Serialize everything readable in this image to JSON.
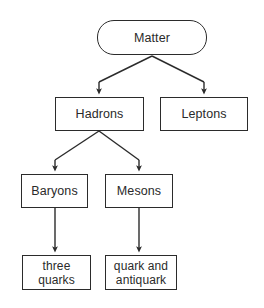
{
  "diagram": {
    "style": {
      "background": "#ffffff",
      "node_fill": "#ffffff",
      "node_stroke": "#2b2b2b",
      "text_color": "#2a2a2a",
      "edge_color": "#2b2b2b"
    },
    "nodes": [
      {
        "id": "matter",
        "label": "Matter",
        "shape": "rounded-rectangle",
        "x": 97,
        "y": 20,
        "width": 110,
        "height": 35
      },
      {
        "id": "hadrons",
        "label": "Hadrons",
        "shape": "rectangle",
        "x": 55,
        "y": 97,
        "width": 89,
        "height": 34
      },
      {
        "id": "leptons",
        "label": "Leptons",
        "shape": "rectangle",
        "x": 160,
        "y": 97,
        "width": 88,
        "height": 34
      },
      {
        "id": "baryons",
        "label": "Baryons",
        "shape": "rectangle",
        "x": 21,
        "y": 174,
        "width": 67,
        "height": 34
      },
      {
        "id": "mesons",
        "label": "Mesons",
        "shape": "rectangle",
        "x": 105,
        "y": 174,
        "width": 68,
        "height": 34
      },
      {
        "id": "three-quarks",
        "label": "three\nquarks",
        "shape": "rectangle",
        "x": 22,
        "y": 255,
        "width": 69,
        "height": 35
      },
      {
        "id": "quark-antiquark",
        "label": "quark and\nantiquark",
        "shape": "rectangle",
        "x": 105,
        "y": 255,
        "width": 72,
        "height": 35
      }
    ],
    "edges": [
      {
        "from": "matter",
        "to": "hadrons",
        "type": "arrow"
      },
      {
        "from": "matter",
        "to": "leptons",
        "type": "arrow"
      },
      {
        "from": "hadrons",
        "to": "baryons",
        "type": "arrow"
      },
      {
        "from": "hadrons",
        "to": "mesons",
        "type": "arrow"
      },
      {
        "from": "baryons",
        "to": "three-quarks",
        "type": "arrow"
      },
      {
        "from": "mesons",
        "to": "quark-antiquark",
        "type": "arrow"
      }
    ]
  }
}
